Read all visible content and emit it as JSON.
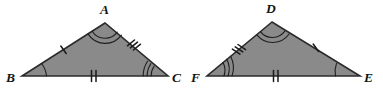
{
  "figure": {
    "background_color": "#ffffff",
    "fill_color": "#8a8a8a",
    "outline_color": "#2b2b2b",
    "mark_color": "#1a1a1a"
  },
  "triangles": [
    {
      "id": "triangle-abc",
      "name": "left-triangle",
      "vertices": [
        {
          "label": "A",
          "role": "apex",
          "x": 105,
          "y": 23,
          "label_x": 100,
          "label_y": 14,
          "arc_count": 1
        },
        {
          "label": "B",
          "role": "bottom-left",
          "x": 22,
          "y": 76,
          "label_x": 6,
          "label_y": 82,
          "arc_count": 1
        },
        {
          "label": "C",
          "role": "bottom-right",
          "x": 168,
          "y": 76,
          "label_x": 172,
          "label_y": 82,
          "arc_count": 3
        }
      ],
      "angle_marks": [
        {
          "at": "A",
          "arcs": 2
        },
        {
          "at": "B",
          "arcs": 1
        },
        {
          "at": "C",
          "arcs": 3
        }
      ],
      "side_marks": [
        {
          "side": "AB",
          "ticks": 1
        },
        {
          "side": "AC",
          "ticks": 3
        },
        {
          "side": "BC",
          "ticks": 2
        }
      ]
    },
    {
      "id": "triangle-def",
      "name": "right-triangle",
      "vertices": [
        {
          "label": "D",
          "role": "apex",
          "x": 272,
          "y": 22,
          "label_x": 266,
          "label_y": 13,
          "arc_count": 1
        },
        {
          "label": "F",
          "role": "bottom-left",
          "x": 207,
          "y": 76,
          "label_x": 191,
          "label_y": 82,
          "arc_count": 3
        },
        {
          "label": "E",
          "role": "bottom-right",
          "x": 360,
          "y": 76,
          "label_x": 364,
          "label_y": 82,
          "arc_count": 1
        }
      ],
      "angle_marks": [
        {
          "at": "D",
          "arcs": 2
        },
        {
          "at": "F",
          "arcs": 3
        },
        {
          "at": "E",
          "arcs": 1
        }
      ],
      "side_marks": [
        {
          "side": "DF",
          "ticks": 3
        },
        {
          "side": "DE",
          "ticks": 1
        },
        {
          "side": "FE",
          "ticks": 2
        }
      ]
    }
  ],
  "labels": {
    "A": "A",
    "B": "B",
    "C": "C",
    "D": "D",
    "E": "E",
    "F": "F"
  }
}
